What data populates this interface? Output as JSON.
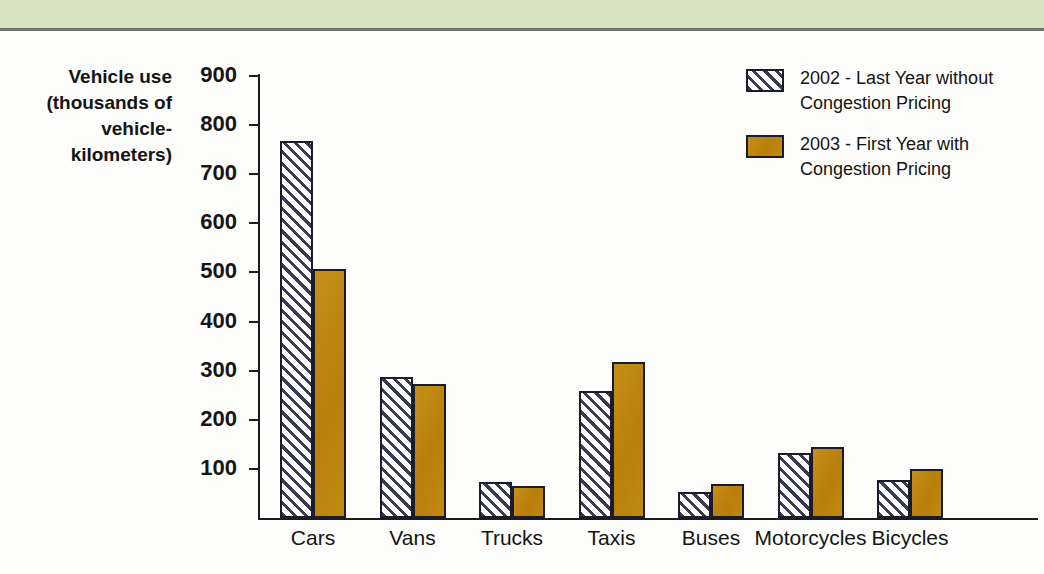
{
  "figure": {
    "background_color": "#fdfdfb",
    "top_band_color": "#d6e3c3",
    "rule_color": "#6f7269"
  },
  "axis": {
    "y_title_lines": [
      "Vehicle use",
      "(thousands of",
      "vehicle-",
      "kilometers)"
    ],
    "y_ticks": [
      900,
      800,
      700,
      600,
      500,
      400,
      300,
      200,
      100
    ],
    "y_min": 0,
    "y_max": 900
  },
  "legend": {
    "position": "top-right",
    "entries": [
      {
        "swatch": "hatched",
        "color": "#ffffff",
        "hatch_color": "#3b3b55",
        "line1": "2002 - Last Year without",
        "line2": "Congestion Pricing"
      },
      {
        "swatch": "solid",
        "color": "#bf8712",
        "line1": "2003 - First Year with",
        "line2": "Congestion Pricing"
      }
    ]
  },
  "chart_data": {
    "type": "bar",
    "title": "",
    "xlabel": "",
    "ylabel": "Vehicle use (thousands of vehicle-kilometers)",
    "ylim": [
      0,
      900
    ],
    "grid": false,
    "legend_position": "top-right",
    "categories": [
      "Cars",
      "Vans",
      "Trucks",
      "Taxis",
      "Buses",
      "Motorcycles",
      "Bicycles"
    ],
    "series": [
      {
        "name": "2002 - Last Year without Congestion Pricing",
        "style": "hatched",
        "color": "#ffffff",
        "values": [
          768,
          288,
          73,
          258,
          52,
          133,
          78
        ]
      },
      {
        "name": "2003 - First Year with Congestion Pricing",
        "style": "solid",
        "color": "#bf8712",
        "values": [
          508,
          272,
          66,
          317,
          70,
          145,
          100
        ]
      }
    ]
  }
}
